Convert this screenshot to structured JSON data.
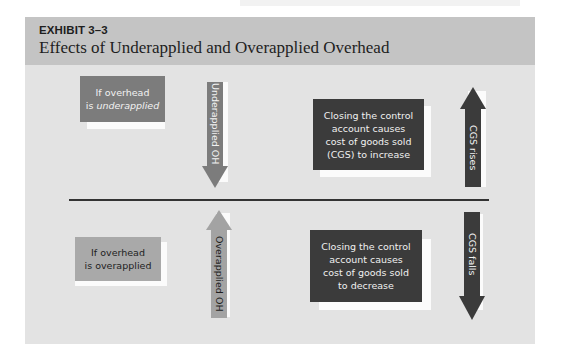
{
  "exhibit": {
    "label": "EXHIBIT 3–3",
    "title": "Effects of Underapplied and Overapplied Overhead"
  },
  "top_row": {
    "condition_box": {
      "line1": "If overhead",
      "line2_prefix": "is ",
      "line2_emphasis": "underapplied"
    },
    "condition_arrow": {
      "label": "Underapplied OH",
      "direction": "down"
    },
    "effect_box": {
      "lines": [
        "Closing the control",
        "account causes",
        "cost of goods sold",
        "(CGS) to increase"
      ]
    },
    "effect_arrow": {
      "label": "CGS rises",
      "direction": "up"
    }
  },
  "bottom_row": {
    "condition_box": {
      "line1": "If overhead",
      "line2": "is overapplied"
    },
    "condition_arrow": {
      "label": "Overapplied OH",
      "direction": "up"
    },
    "effect_box": {
      "lines": [
        "Closing the control",
        "account causes",
        "cost of goods sold",
        "to decrease"
      ]
    },
    "effect_arrow": {
      "label": "CGS falls",
      "direction": "down"
    }
  },
  "colors": {
    "header_bg": "#c4c4c4",
    "panel_bg": "#e3e3e3",
    "mid_gray": "#7c7c7c",
    "light_gray": "#a9a9a9",
    "dark_gray": "#3b3b3b",
    "shadow": "#fbfbfb"
  }
}
